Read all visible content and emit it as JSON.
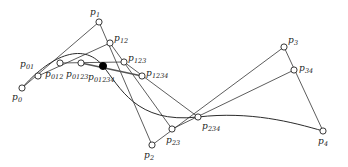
{
  "figure": {
    "width": 348,
    "height": 167,
    "background": "#ffffff",
    "line_color": "#333333",
    "node_fill": "#ffffff",
    "node_stroke": "#222222",
    "highlight_color": "#000000",
    "thick_line_color": "#555555"
  },
  "points": [
    {
      "id": "p0",
      "label": "p",
      "sub": "0",
      "x": 22,
      "y": 88,
      "marker": "open",
      "label_x": 12,
      "label_y": 93
    },
    {
      "id": "p01",
      "label": "p",
      "sub": "01",
      "x": 38,
      "y": 76,
      "marker": "open",
      "label_x": 20,
      "label_y": 60
    },
    {
      "id": "p012",
      "label": "p",
      "sub": "012",
      "x": 60,
      "y": 63,
      "marker": "open",
      "label_x": 45,
      "label_y": 70
    },
    {
      "id": "p0123",
      "label": "p",
      "sub": "0123",
      "x": 81,
      "y": 63,
      "marker": "open",
      "label_x": 66,
      "label_y": 70
    },
    {
      "id": "p01234",
      "label": "p",
      "sub": "01234",
      "x": 103,
      "y": 66,
      "marker": "filled",
      "label_x": 88,
      "label_y": 73
    },
    {
      "id": "p1",
      "label": "p",
      "sub": "1",
      "x": 99,
      "y": 22,
      "marker": "open",
      "label_x": 90,
      "label_y": 8
    },
    {
      "id": "p12",
      "label": "p",
      "sub": "12",
      "x": 110,
      "y": 43,
      "marker": "open",
      "label_x": 114,
      "label_y": 34
    },
    {
      "id": "p123",
      "label": "p",
      "sub": "123",
      "x": 124,
      "y": 62,
      "marker": "open",
      "label_x": 128,
      "label_y": 54
    },
    {
      "id": "p1234",
      "label": "p",
      "sub": "1234",
      "x": 142,
      "y": 76,
      "marker": "open",
      "label_x": 146,
      "label_y": 69
    },
    {
      "id": "p2",
      "label": "p",
      "sub": "2",
      "x": 152,
      "y": 145,
      "marker": "open",
      "label_x": 144,
      "label_y": 151
    },
    {
      "id": "p23",
      "label": "p",
      "sub": "23",
      "x": 172,
      "y": 129,
      "marker": "open",
      "label_x": 166,
      "label_y": 136
    },
    {
      "id": "p234",
      "label": "p",
      "sub": "234",
      "x": 198,
      "y": 117,
      "marker": "open",
      "label_x": 202,
      "label_y": 122
    },
    {
      "id": "p3",
      "label": "p",
      "sub": "3",
      "x": 284,
      "y": 47,
      "marker": "open",
      "label_x": 288,
      "label_y": 36
    },
    {
      "id": "p34",
      "label": "p",
      "sub": "34",
      "x": 294,
      "y": 70,
      "marker": "open",
      "label_x": 299,
      "label_y": 64
    },
    {
      "id": "p4",
      "label": "p",
      "sub": "4",
      "x": 323,
      "y": 131,
      "marker": "open",
      "label_x": 318,
      "label_y": 137
    }
  ],
  "segments": [
    {
      "name": "p0-p1",
      "from": "p0",
      "to": "p1",
      "style": "thin"
    },
    {
      "name": "p1-p2",
      "from": "p1",
      "to": "p2",
      "style": "thin"
    },
    {
      "name": "p2-p3",
      "from": "p2",
      "to": "p3",
      "style": "thin"
    },
    {
      "name": "p3-p4",
      "from": "p3",
      "to": "p4",
      "style": "thin"
    },
    {
      "name": "p01-p12",
      "from": "p01",
      "to": "p12",
      "style": "thin"
    },
    {
      "name": "p12-p23",
      "from": "p12",
      "to": "p23",
      "style": "thin"
    },
    {
      "name": "p23-p34",
      "from": "p23",
      "to": "p34",
      "style": "thin"
    },
    {
      "name": "p012-p123",
      "from": "p012",
      "to": "p123",
      "style": "thin"
    },
    {
      "name": "p123-p234",
      "from": "p123",
      "to": "p234",
      "style": "thin"
    },
    {
      "name": "p0123-p1234",
      "from": "p0123",
      "to": "p1234",
      "style": "thick"
    }
  ],
  "curve": {
    "name": "bezier-curve",
    "description": "quartic Bezier curve through p0 and p4",
    "path": "M 22 88 C 48 58 82 40 103 66 C 120 87 136 124 198 117 C 250 111 292 122 323 131"
  },
  "marker_radius": 3.1
}
